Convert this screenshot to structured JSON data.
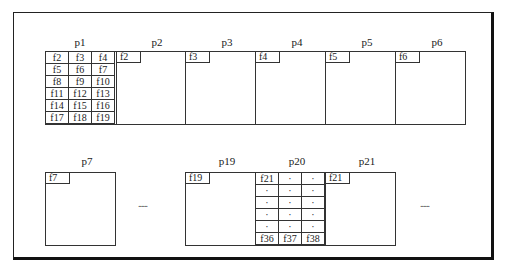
{
  "diagram": {
    "row1": {
      "labels": {
        "p1": "p1",
        "p2": "p2",
        "p3": "p3",
        "p4": "p4",
        "p5": "p5",
        "p6": "p6"
      },
      "p1_grid": [
        [
          "f2",
          "f3",
          "f4"
        ],
        [
          "f5",
          "f6",
          "f7"
        ],
        [
          "f8",
          "f9",
          "f10"
        ],
        [
          "f11",
          "f12",
          "f13"
        ],
        [
          "f14",
          "f15",
          "f16"
        ],
        [
          "f17",
          "f18",
          "f19"
        ]
      ],
      "tags": {
        "p2": "f2",
        "p3": "f3",
        "p4": "f4",
        "p5": "f5",
        "p6": "f6"
      }
    },
    "row2": {
      "labels": {
        "p7": "p7",
        "p19": "p19",
        "p20": "p20",
        "p21": "p21"
      },
      "tags": {
        "p7": "f7",
        "p19": "f19",
        "p21": "f21"
      },
      "p20_grid": [
        [
          "f21",
          "·",
          "·"
        ],
        [
          "·",
          "·",
          "·"
        ],
        [
          "·",
          "·",
          "·"
        ],
        [
          "·",
          "·",
          "·"
        ],
        [
          "·",
          "·",
          "·"
        ],
        [
          "f36",
          "f37",
          "f38"
        ]
      ],
      "ellipsis_left": "......",
      "ellipsis_right": "......"
    }
  }
}
